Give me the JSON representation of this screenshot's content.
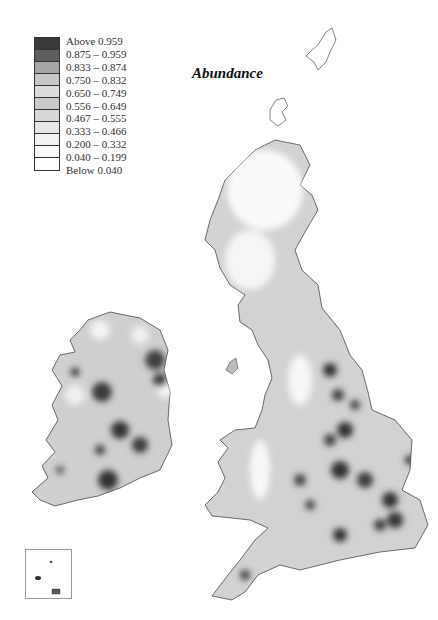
{
  "title": "Abundance",
  "legend": {
    "items": [
      {
        "label": "Above 0.959",
        "color": "#3a3a3a"
      },
      {
        "label": "0.875 – 0.959",
        "color": "#5e5e5e"
      },
      {
        "label": "0.833 – 0.874",
        "color": "#a6a6a6"
      },
      {
        "label": "0.750 – 0.832",
        "color": "#c8c8c8"
      },
      {
        "label": "0.650 – 0.749",
        "color": "#dcdcdc"
      },
      {
        "label": "0.556 – 0.649",
        "color": "#c9c9c9"
      },
      {
        "label": "0.467 – 0.555",
        "color": "#d8d8d8"
      },
      {
        "label": "0.333 – 0.466",
        "color": "#e6e6e6"
      },
      {
        "label": "0.200 – 0.332",
        "color": "#f2f2f2"
      },
      {
        "label": "0.040 – 0.199",
        "color": "#fafafa"
      },
      {
        "label": "Below 0.040",
        "color": "#ffffff"
      }
    ]
  },
  "map": {
    "regions": [
      "Shetland",
      "Orkney",
      "Scotland",
      "Ireland",
      "England",
      "Wales",
      "Channel Islands inset"
    ],
    "outline_color": "#333333",
    "high_color": "#3a3a3a",
    "low_color": "#ffffff"
  }
}
